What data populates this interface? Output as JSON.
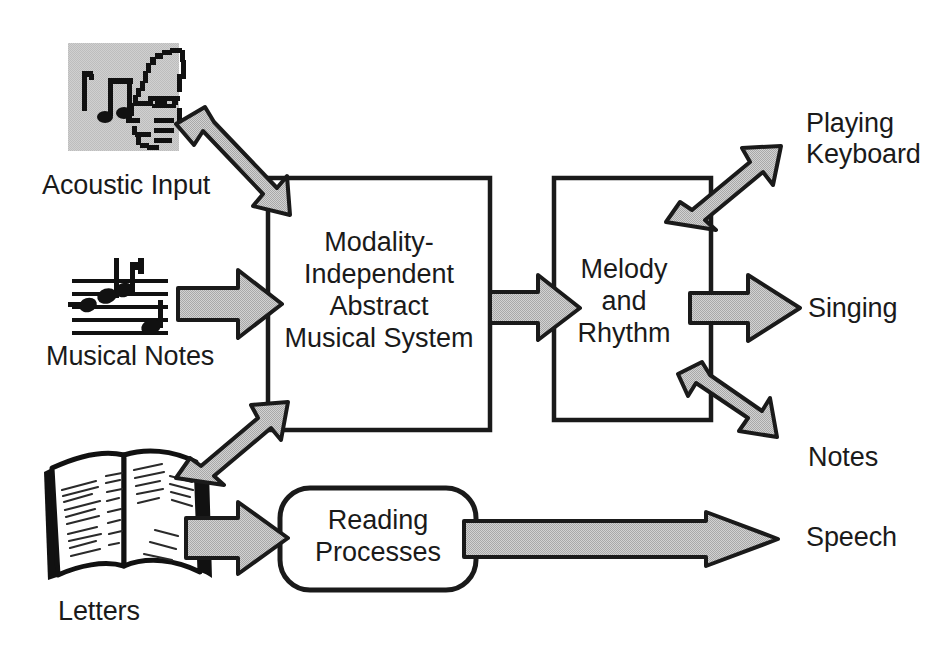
{
  "figure": {
    "type": "block-diagram",
    "background_color": "#ffffff",
    "line_color": "#1a1a1a",
    "arrow_fill_color": "#c6c6c6",
    "arrow_outline_color": "#1a1a1a",
    "icon_panel_color": "#c8c8c8"
  },
  "inputs": [
    {
      "id": "acoustic",
      "label": "Acoustic Input",
      "icon": "face-profile-with-music-notes-icon"
    },
    {
      "id": "notes",
      "label": "Musical Notes",
      "icon": "musical-staff-icon"
    },
    {
      "id": "letters",
      "label": "Letters",
      "icon": "open-book-icon"
    }
  ],
  "boxes": [
    {
      "id": "abstract-musical-system",
      "shape": "rectangle",
      "lines": [
        "Modality-",
        "Independent",
        "Abstract",
        "Musical System"
      ]
    },
    {
      "id": "melody-and-rhythm",
      "shape": "rectangle",
      "lines": [
        "Melody",
        "and",
        "Rhythm"
      ]
    },
    {
      "id": "reading-processes",
      "shape": "rounded-rectangle",
      "lines": [
        "Reading",
        "Processes"
      ]
    }
  ],
  "outputs": [
    {
      "id": "playing-keyboard",
      "lines": [
        "Playing",
        "Keyboard"
      ]
    },
    {
      "id": "singing",
      "lines": [
        "Singing"
      ]
    },
    {
      "id": "notes-output",
      "lines": [
        "Notes"
      ]
    },
    {
      "id": "speech",
      "lines": [
        "Speech"
      ]
    }
  ],
  "arrows": [
    {
      "id": "acoustic-to-system",
      "from": "acoustic",
      "to": "abstract-musical-system",
      "direction": "down-right"
    },
    {
      "id": "notes-to-system",
      "from": "notes",
      "to": "abstract-musical-system",
      "direction": "right"
    },
    {
      "id": "letters-to-system",
      "from": "letters",
      "to": "abstract-musical-system",
      "direction": "up-right"
    },
    {
      "id": "letters-to-reading",
      "from": "letters",
      "to": "reading-processes",
      "direction": "right"
    },
    {
      "id": "system-to-melody",
      "from": "abstract-musical-system",
      "to": "melody-and-rhythm",
      "direction": "right"
    },
    {
      "id": "melody-to-keyboard",
      "from": "melody-and-rhythm",
      "to": "playing-keyboard",
      "direction": "up-right"
    },
    {
      "id": "melody-to-singing",
      "from": "melody-and-rhythm",
      "to": "singing",
      "direction": "right"
    },
    {
      "id": "melody-to-notes",
      "from": "melody-and-rhythm",
      "to": "notes-output",
      "direction": "down-right"
    },
    {
      "id": "reading-to-speech",
      "from": "reading-processes",
      "to": "speech",
      "direction": "right"
    }
  ],
  "labels": {
    "acoustic_input": "Acoustic Input",
    "musical_notes": "Musical Notes",
    "letters": "Letters",
    "system_l1": "Modality-",
    "system_l2": "Independent",
    "system_l3": "Abstract",
    "system_l4": "Musical System",
    "melody_l1": "Melody",
    "melody_l2": "and",
    "melody_l3": "Rhythm",
    "reading_l1": "Reading",
    "reading_l2": "Processes",
    "playing": "Playing",
    "keyboard": "Keyboard",
    "singing": "Singing",
    "notes_out": "Notes",
    "speech": "Speech"
  }
}
